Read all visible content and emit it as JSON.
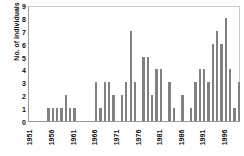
{
  "chart_data": {
    "type": "bar",
    "title": "",
    "xlabel": "",
    "ylabel": "No. of individuals",
    "ylim": [
      0,
      9
    ],
    "ytick_values": [
      0,
      1,
      2,
      3,
      4,
      5,
      6,
      7,
      8,
      9
    ],
    "grid": false,
    "legend": null,
    "bar_color": "#808080",
    "axis_color": "#9a9a9a",
    "xtick_labels": [
      "1951",
      "1956",
      "1961",
      "1966",
      "1971",
      "1976",
      "1981",
      "1986",
      "1991",
      "1996"
    ],
    "xtick_years": [
      1951,
      1956,
      1961,
      1966,
      1971,
      1976,
      1981,
      1986,
      1991,
      1996
    ],
    "x_start_year": 1951,
    "x_end_year": 1999,
    "categories": [
      "1951",
      "1952",
      "1953",
      "1954",
      "1955",
      "1956",
      "1957",
      "1958",
      "1959",
      "1960",
      "1961",
      "1962",
      "1963",
      "1964",
      "1965",
      "1966",
      "1967",
      "1968",
      "1969",
      "1970",
      "1971",
      "1972",
      "1973",
      "1974",
      "1975",
      "1976",
      "1977",
      "1978",
      "1979",
      "1980",
      "1981",
      "1982",
      "1983",
      "1984",
      "1985",
      "1986",
      "1987",
      "1988",
      "1989",
      "1990",
      "1991",
      "1992",
      "1993",
      "1994",
      "1995",
      "1996",
      "1997",
      "1998",
      "1999"
    ],
    "values": [
      0,
      0,
      0,
      0,
      1,
      1,
      1,
      1,
      2,
      1,
      1,
      0,
      0,
      0,
      0,
      3,
      1,
      3,
      3,
      2,
      0,
      2,
      3,
      7,
      3,
      0,
      5,
      5,
      2,
      4,
      4,
      0,
      3,
      1,
      0,
      2,
      0,
      1,
      3,
      4,
      4,
      3,
      6,
      7,
      6,
      8,
      4,
      1,
      3
    ]
  }
}
